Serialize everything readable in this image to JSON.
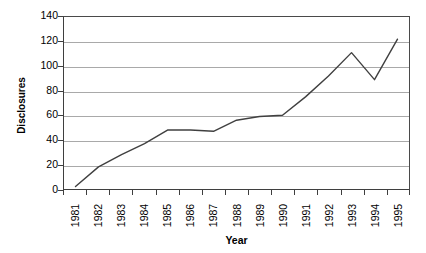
{
  "chart_data": {
    "type": "line",
    "title": "",
    "xlabel": "Year",
    "ylabel": "Disclosures",
    "categories": [
      "1981",
      "1982",
      "1983",
      "1984",
      "1985",
      "1986",
      "1987",
      "1988",
      "1989",
      "1990",
      "1991",
      "1992",
      "1993",
      "1994",
      "1995"
    ],
    "values": [
      2,
      18,
      28,
      37,
      48,
      48,
      47,
      56,
      59,
      60,
      75,
      92,
      111,
      89,
      122
    ],
    "series": [
      {
        "name": "Disclosures",
        "values": [
          2,
          18,
          28,
          37,
          48,
          48,
          47,
          56,
          59,
          60,
          75,
          92,
          111,
          89,
          122
        ]
      }
    ],
    "ylim": [
      0,
      140
    ],
    "yticks": [
      0,
      20,
      40,
      60,
      80,
      100,
      120,
      140
    ],
    "ytick_labels": [
      "0",
      "20",
      "40",
      "60",
      "80",
      "100",
      "120",
      "140"
    ],
    "grid": "horizontal",
    "legend": "none",
    "line_color": "#404040",
    "gridline_color": "#a9a9a9",
    "axis_color": "#3f3f3f",
    "background_color": "#ffffff"
  }
}
